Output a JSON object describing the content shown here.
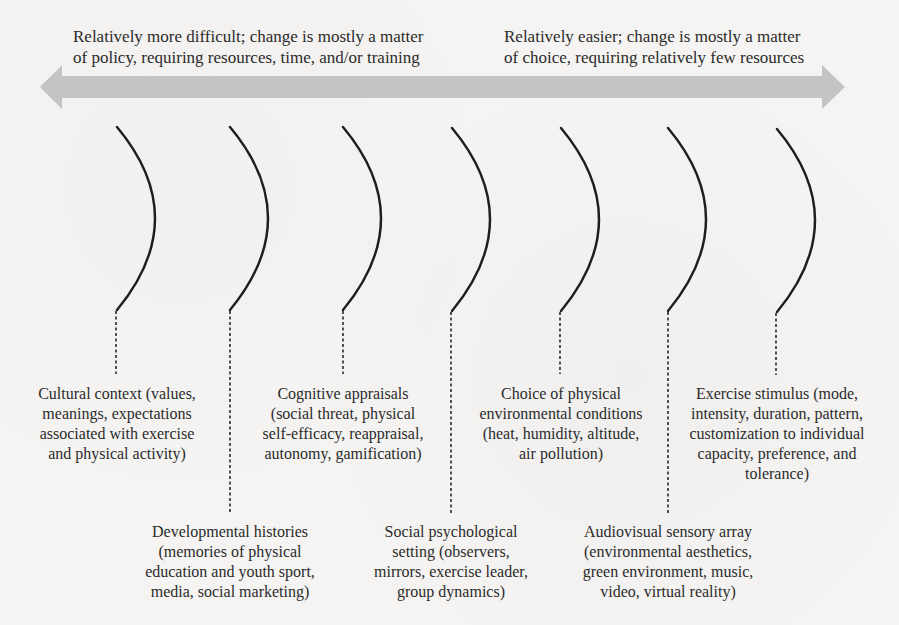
{
  "header": {
    "left": {
      "lines": [
        "Relatively more difficult; change is mostly a matter",
        "of policy, requiring resources, time, and/or training"
      ]
    },
    "right": {
      "lines": [
        "Relatively easier; change is mostly a matter",
        "of choice, requiring relatively few resources"
      ]
    }
  },
  "arrow": {
    "color": "#c4c4c4",
    "direction": "bidirectional"
  },
  "colors": {
    "background": "#f5f4f2",
    "curve": "#1e1e1e",
    "text": "#2b2b2b"
  },
  "factors": [
    {
      "id": 1,
      "position": "upper",
      "title": "Cultural context",
      "lines": [
        "Cultural context (values,",
        "meanings, expectations",
        "associated with exercise",
        "and physical activity)"
      ]
    },
    {
      "id": 2,
      "position": "lower",
      "title": "Developmental histories",
      "lines": [
        "Developmental histories",
        "(memories of physical",
        "education and youth sport,",
        "media, social marketing)"
      ]
    },
    {
      "id": 3,
      "position": "upper",
      "title": "Cognitive appraisals",
      "lines": [
        "Cognitive appraisals",
        "(social threat, physical",
        "self-efficacy, reappraisal,",
        "autonomy, gamification)"
      ]
    },
    {
      "id": 4,
      "position": "lower",
      "title": "Social psychological setting",
      "lines": [
        "Social psychological",
        "setting (observers,",
        "mirrors, exercise leader,",
        "group dynamics)"
      ]
    },
    {
      "id": 5,
      "position": "upper",
      "title": "Choice of physical environmental conditions",
      "lines": [
        "Choice of physical",
        "environmental conditions",
        "(heat, humidity, altitude,",
        "air pollution)"
      ]
    },
    {
      "id": 6,
      "position": "lower",
      "title": "Audiovisual sensory array",
      "lines": [
        "Audiovisual sensory array",
        "(environmental aesthetics,",
        "green environment, music,",
        "video, virtual reality)"
      ]
    },
    {
      "id": 7,
      "position": "upper",
      "title": "Exercise stimulus",
      "lines": [
        "Exercise stimulus (mode,",
        "intensity, duration, pattern,",
        "customization to individual",
        "capacity, preference, and",
        "tolerance)"
      ]
    }
  ]
}
